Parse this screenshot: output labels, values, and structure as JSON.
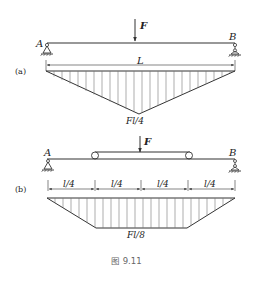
{
  "figure": {
    "caption": "图 9.11",
    "line_color": "#333333",
    "hatch_color": "#777777"
  },
  "diagram_a": {
    "label": "(a)",
    "load_label": "F",
    "support_left": "A",
    "support_right": "B",
    "span_label": "L",
    "moment_max_label": "Fl/4",
    "shape": "triangle"
  },
  "diagram_b": {
    "label": "(b)",
    "load_label": "F",
    "support_left": "A",
    "support_right": "B",
    "segment_labels": [
      "l/4",
      "l/4",
      "l/4",
      "l/4"
    ],
    "moment_max_label": "Fl/8",
    "shape": "trapezoid"
  }
}
